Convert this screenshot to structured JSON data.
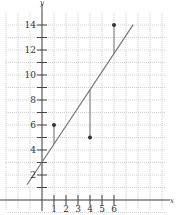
{
  "chart_data": {
    "type": "scatter",
    "title": "",
    "xlabel": "x",
    "ylabel": "y",
    "x_ticks": [
      1,
      2,
      3,
      4,
      5,
      6
    ],
    "y_ticks": [
      2,
      4,
      6,
      8,
      10,
      12,
      14
    ],
    "xlim": [
      -3,
      10
    ],
    "ylim": [
      -1,
      15
    ],
    "grid": true,
    "points": [
      {
        "x": 1,
        "y": 6
      },
      {
        "x": 4,
        "y": 5
      },
      {
        "x": 6,
        "y": 14
      }
    ],
    "regression_line": {
      "slope": 1.447,
      "intercept": 3.03,
      "x_start": -1.25,
      "x_end": 7.6
    },
    "colors": {
      "point": "#333333",
      "line": "#777777",
      "axis": "#444444",
      "grid": "#bbbbbb"
    }
  }
}
